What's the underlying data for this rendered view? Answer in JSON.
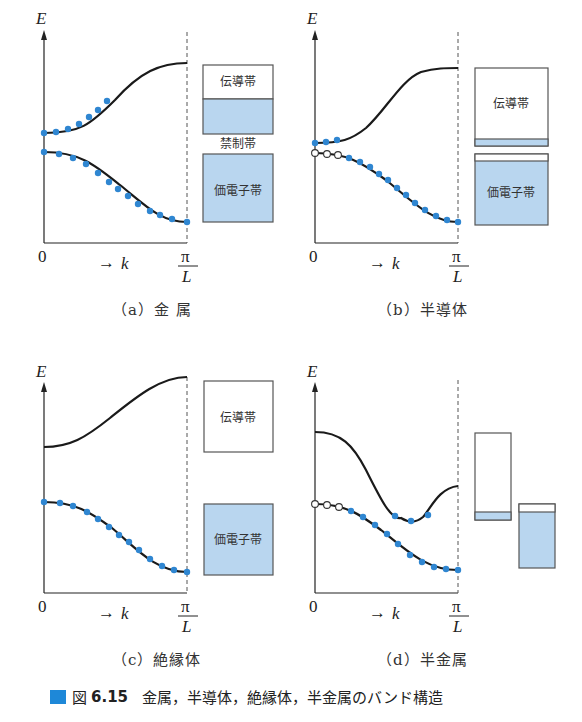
{
  "figure": {
    "number": "図 6.15",
    "title": "金属，半導体，絶縁体，半金属のバンド構造",
    "accent_color": "#1e88d8"
  },
  "axis": {
    "y_label": "E",
    "x_origin": "0",
    "x_label": "k",
    "x_arrow": "→",
    "x_end_numerator": "π",
    "x_end_denominator": "L"
  },
  "band_labels": {
    "conduction": "伝導帯",
    "forbidden": "禁制帯",
    "valence": "価電子帯"
  },
  "panels": [
    {
      "id": "a",
      "caption": "（a）金 属",
      "material": "金属"
    },
    {
      "id": "b",
      "caption": "（b）半導体",
      "material": "半導体"
    },
    {
      "id": "c",
      "caption": "（c）絶縁体",
      "material": "絶縁体"
    },
    {
      "id": "d",
      "caption": "（d）半金属",
      "material": "半金属"
    }
  ],
  "colors": {
    "electron_dot": "#2f86d1",
    "filled_band": "#b9d6ef",
    "curve": "#1a1a1a",
    "box_border": "#555555"
  },
  "legend": {
    "filled_dot": "occupied state (electron)",
    "open_dot": "empty state (hole)"
  }
}
